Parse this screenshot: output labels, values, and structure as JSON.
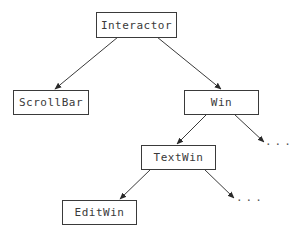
{
  "diagram": {
    "type": "class-hierarchy-tree",
    "nodes": {
      "interactor": {
        "label": "Interactor"
      },
      "scrollbar": {
        "label": "ScrollBar"
      },
      "win": {
        "label": "Win"
      },
      "textwin": {
        "label": "TextWin"
      },
      "editwin": {
        "label": "EditWin"
      }
    },
    "ellipses": {
      "win_more": "...",
      "textwin_more": "..."
    },
    "edges": [
      {
        "from": "Interactor",
        "to": "ScrollBar"
      },
      {
        "from": "Interactor",
        "to": "Win"
      },
      {
        "from": "Win",
        "to": "TextWin"
      },
      {
        "from": "Win",
        "to": "..."
      },
      {
        "from": "TextWin",
        "to": "EditWin"
      },
      {
        "from": "TextWin",
        "to": "..."
      }
    ],
    "colors": {
      "stroke": "#3a3a3a",
      "background": "#ffffff"
    }
  }
}
